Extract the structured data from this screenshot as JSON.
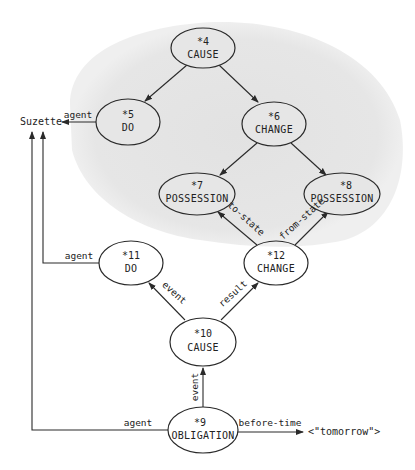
{
  "diagram": {
    "shaded_region_color": "#e4e4e4",
    "nodes": [
      {
        "id": "*4",
        "type": "CAUSE"
      },
      {
        "id": "*5",
        "type": "DO"
      },
      {
        "id": "*6",
        "type": "CHANGE"
      },
      {
        "id": "*7",
        "type": "POSSESSION"
      },
      {
        "id": "*8",
        "type": "POSSESSION"
      },
      {
        "id": "*9",
        "type": "OBLIGATION"
      },
      {
        "id": "*10",
        "type": "CAUSE"
      },
      {
        "id": "*11",
        "type": "DO"
      },
      {
        "id": "*12",
        "type": "CHANGE"
      }
    ],
    "entities": {
      "suzette": "Suzette",
      "tomorrow": "<\"tomorrow\">"
    },
    "edge_labels": {
      "agent_5": "agent",
      "agent_11": "agent",
      "agent_9": "agent",
      "to_state": "to-state",
      "from_state": "from-state",
      "event_11": "event",
      "result": "result",
      "event_10": "event",
      "before_time": "before-time"
    }
  }
}
